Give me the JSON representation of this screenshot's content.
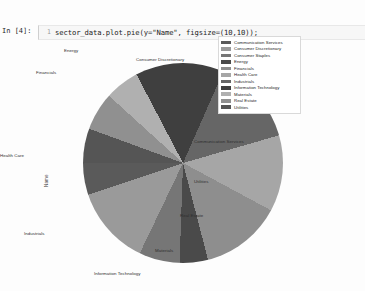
{
  "notebook": {
    "prompt": "In [4]:",
    "line_number": "1",
    "code": "sector_data.plot.pie(y=\"Name\", figsize=(10,10));"
  },
  "legend": {
    "entries": [
      {
        "label": "Communication Services",
        "color": "#5a5a5a"
      },
      {
        "label": "Consumer Discretionary",
        "color": "#9a9a9a"
      },
      {
        "label": "Consumer Staples",
        "color": "#767676"
      },
      {
        "label": "Energy",
        "color": "#4a4a4a"
      },
      {
        "label": "Financials",
        "color": "#8e8e8e"
      },
      {
        "label": "Health Care",
        "color": "#a6a6a6"
      },
      {
        "label": "Industrials",
        "color": "#666666"
      },
      {
        "label": "Information Technology",
        "color": "#3f3f3f"
      },
      {
        "label": "Materials",
        "color": "#b0b0b0"
      },
      {
        "label": "Real Estate",
        "color": "#909090"
      },
      {
        "label": "Utilities",
        "color": "#555555"
      }
    ]
  },
  "axis": {
    "ylabel": "Name"
  },
  "wedge_labels": [
    {
      "text": "Energy",
      "left": "64px",
      "top": "16px"
    },
    {
      "text": "Consumer Discretionary",
      "left": "136px",
      "top": "25px"
    },
    {
      "text": "Financials",
      "left": "36px",
      "top": "38px"
    },
    {
      "text": "Communication Services",
      "left": "194px",
      "top": "107px"
    },
    {
      "text": "Health Care",
      "left": "0px",
      "top": "121px"
    },
    {
      "text": "Utilities",
      "left": "194px",
      "top": "147px"
    },
    {
      "text": "Real Estate",
      "left": "180px",
      "top": "181px"
    },
    {
      "text": "Materials",
      "left": "155px",
      "top": "216px"
    },
    {
      "text": "Industrials",
      "left": "24px",
      "top": "199px"
    },
    {
      "text": "Information Technology",
      "left": "94px",
      "top": "239px"
    }
  ],
  "chart_data": {
    "type": "pie",
    "title": "",
    "column": "Name",
    "figsize": "(10,10)",
    "legend_position": "upper right",
    "ylabel": "Name",
    "categories": [
      "Communication Services",
      "Consumer Discretionary",
      "Consumer Staples",
      "Energy",
      "Financials",
      "Health Care",
      "Industrials",
      "Information Technology",
      "Materials",
      "Real Estate",
      "Utilities"
    ],
    "values": [
      26,
      64,
      33,
      23,
      66,
      62,
      70,
      72,
      28,
      31,
      28
    ],
    "percentages": [
      5.2,
      12.8,
      6.6,
      4.6,
      13.2,
      12.4,
      14.0,
      14.4,
      5.6,
      6.2,
      5.6
    ],
    "colors": [
      "#5a5a5a",
      "#9a9a9a",
      "#767676",
      "#4a4a4a",
      "#8e8e8e",
      "#a6a6a6",
      "#666666",
      "#3f3f3f",
      "#b0b0b0",
      "#909090",
      "#555555"
    ],
    "start_angle_deg": 0,
    "direction": "counterclockwise",
    "grid": false
  }
}
